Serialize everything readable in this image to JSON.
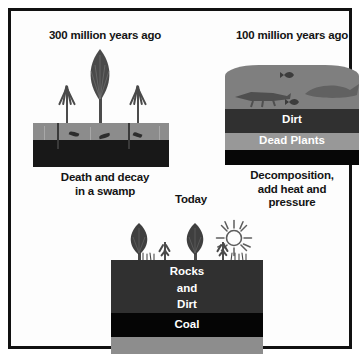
{
  "figure": {
    "border_color": "#111111",
    "background_color": "#ffffff"
  },
  "palette": {
    "soil_gray": "#8c8c8c",
    "peat_black": "#181818",
    "water_gray": "#7f7f7f",
    "dirt_dark": "#303030",
    "dead_plants_gray": "#989898",
    "bedrock_black": "#070707",
    "coal_black": "#050505",
    "plant_gray": "#4a4a4a",
    "label_white": "#ffffff",
    "text_black": "#141414"
  },
  "panels": [
    {
      "id": "past",
      "title": "300 million years ago",
      "caption": "Death and decay\nin a swamp",
      "layers": [
        {
          "name": "soil",
          "label": "",
          "color": "#8c8c8c"
        },
        {
          "name": "peat",
          "label": "",
          "color": "#181818"
        }
      ]
    },
    {
      "id": "middle",
      "title": "100 million years ago",
      "caption": "Decomposition,\nadd heat and\npressure",
      "layers": [
        {
          "name": "water",
          "label": "",
          "color": "#7f7f7f"
        },
        {
          "name": "dirt",
          "label": "Dirt",
          "color": "#303030"
        },
        {
          "name": "dead-plants",
          "label": "Dead Plants",
          "color": "#989898"
        },
        {
          "name": "bedrock",
          "label": "",
          "color": "#070707"
        }
      ]
    },
    {
      "id": "today",
      "title": "Today",
      "caption": "",
      "layers": [
        {
          "name": "rocks-and-dirt",
          "label": "Rocks\nand\nDirt",
          "color": "#303030"
        },
        {
          "name": "coal",
          "label": "Coal",
          "color": "#050505"
        },
        {
          "name": "base",
          "label": "",
          "color": "#8d8d8d"
        }
      ]
    }
  ],
  "icons": {
    "sun": "sun-icon",
    "fern": "fern-plant-icon",
    "tree": "tree-plant-icon",
    "fish": "fish-icon",
    "whale": "whale-icon",
    "crocodile": "crocodile-icon"
  }
}
